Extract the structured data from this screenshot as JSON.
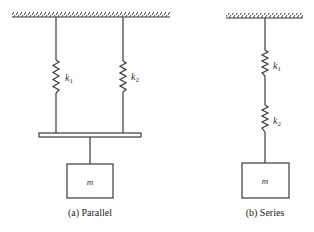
{
  "diagram": {
    "parallel": {
      "caption": "(a) Parallel",
      "spring1_label": "k",
      "spring1_sub": "1",
      "spring2_label": "k",
      "spring2_sub": "2",
      "mass_label": "m"
    },
    "series": {
      "caption": "(b) Series",
      "spring1_label": "k",
      "spring1_sub": "1",
      "spring2_label": "k",
      "spring2_sub": "2",
      "mass_label": "m"
    },
    "colors": {
      "line": "#3a3a3a",
      "background": "#ffffff"
    }
  }
}
